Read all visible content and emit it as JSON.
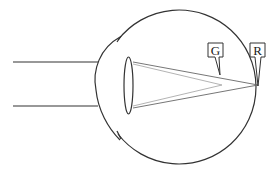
{
  "diagram": {
    "type": "eye-cross-section",
    "labels": [
      {
        "id": "G",
        "text": "G",
        "x": 215,
        "y": 50,
        "pointer_to": [
          220,
          78
        ]
      },
      {
        "id": "R",
        "text": "R",
        "x": 257,
        "y": 50,
        "pointer_to": [
          258,
          85
        ]
      }
    ],
    "colors": {
      "outline": "#333333",
      "ray_dark": "#555555",
      "ray_light": "#aaaaaa",
      "background": "#ffffff"
    }
  }
}
